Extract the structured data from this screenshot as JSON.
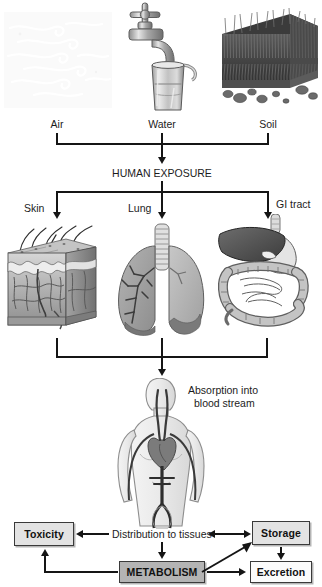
{
  "diagram": {
    "source_labels": [
      {
        "id": "air",
        "label": "Air"
      },
      {
        "id": "water",
        "label": "Water"
      },
      {
        "id": "soil",
        "label": "Soil"
      }
    ],
    "exposure_node": {
      "label": "HUMAN EXPOSURE"
    },
    "route_labels": [
      {
        "id": "skin",
        "label": "Skin"
      },
      {
        "id": "lung",
        "label": "Lung"
      },
      {
        "id": "gi-tract",
        "label": "GI tract"
      }
    ],
    "absorption": {
      "line1": "Absorption into",
      "line2": "blood stream"
    },
    "fate_nodes": [
      {
        "id": "toxicity",
        "label": "Toxicity",
        "style": "shaded"
      },
      {
        "id": "distribution",
        "label": "Distribution to tissues",
        "style": "plain-text"
      },
      {
        "id": "storage",
        "label": "Storage",
        "style": "shaded"
      },
      {
        "id": "metabolism",
        "label": "METABOLISM",
        "style": "dark"
      },
      {
        "id": "excretion",
        "label": "Excretion",
        "style": "light"
      }
    ],
    "colors": {
      "line": "#151515",
      "box_shaded": "#e3e3e3",
      "box_dark": "#b4b4b4",
      "box_light": "#fbfbfb",
      "box_border": "#3a3a3a",
      "text": "#1c1c1c",
      "background": "#ffffff",
      "art_gray_dark": "#6e6e6e",
      "art_gray_mid": "#9a9a9a",
      "art_gray_light": "#c9c9c9",
      "air_swirl": "#f0f0f0"
    },
    "illustration_names": [
      "air-wind-swirls-image",
      "water-faucet-glass-image",
      "soil-grass-block-image",
      "skin-cross-section-image",
      "lungs-image",
      "gi-tract-image",
      "human-circulatory-figure-image"
    ]
  }
}
